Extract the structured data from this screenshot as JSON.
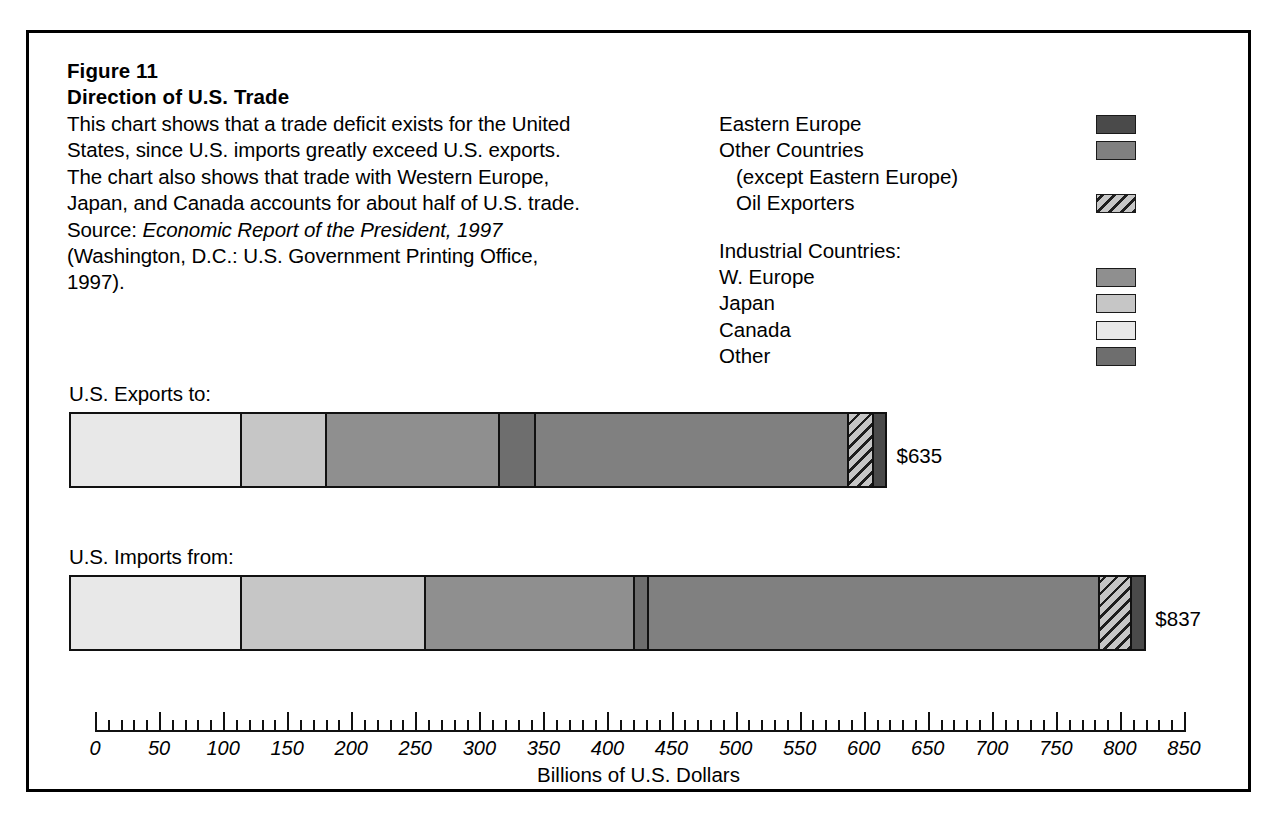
{
  "figure": {
    "number": "Figure 11",
    "title": "Direction of U.S. Trade",
    "caption_part1": "This chart shows that a trade deficit exists for the United States, since U.S. imports greatly exceed U.S. exports. The chart also shows that trade with Western Europe, Japan, and Canada accounts for about half of U.S. trade. Source: ",
    "caption_source_italic": "Economic Report of the President, 1997",
    "caption_part2": " (Washington, D.C.: U.S. Government Printing Office, 1997)."
  },
  "legend": {
    "items": [
      {
        "label": "Eastern Europe",
        "swatch": "solid",
        "color": "#4a4a4a",
        "indent": false,
        "has_swatch": true
      },
      {
        "label": "Other Countries",
        "swatch": "solid",
        "color": "#808080",
        "indent": false,
        "has_swatch": true
      },
      {
        "label": "(except Eastern Europe)",
        "swatch": "none",
        "color": "",
        "indent": true,
        "has_swatch": false
      },
      {
        "label": "Oil Exporters",
        "swatch": "hatch",
        "color": "#b9b9b9",
        "indent": true,
        "has_swatch": true
      }
    ],
    "group_heading": "Industrial Countries:",
    "group_items": [
      {
        "label": "W. Europe",
        "swatch": "solid",
        "color": "#8f8f8f",
        "indent": false,
        "has_swatch": true
      },
      {
        "label": "Japan",
        "swatch": "solid",
        "color": "#c6c6c6",
        "indent": false,
        "has_swatch": true
      },
      {
        "label": "Canada",
        "swatch": "solid",
        "color": "#e8e8e8",
        "indent": false,
        "has_swatch": true
      },
      {
        "label": "Other",
        "swatch": "solid",
        "color": "#6e6e6e",
        "indent": false,
        "has_swatch": true
      }
    ]
  },
  "chart_data": {
    "type": "bar",
    "orientation": "horizontal",
    "stacked": true,
    "title": "Direction of U.S. Trade",
    "xlabel": "Billions of U.S. Dollars",
    "ylabel": "",
    "xlim": [
      0,
      850
    ],
    "xticks": [
      0,
      50,
      100,
      150,
      200,
      250,
      300,
      350,
      400,
      450,
      500,
      550,
      600,
      650,
      700,
      750,
      800,
      850
    ],
    "xtick_labels": [
      "0",
      "50",
      "100",
      "150",
      "200",
      "250",
      "300",
      "350",
      "400",
      "450",
      "500",
      "550",
      "600",
      "650",
      "700",
      "750",
      "800",
      "850"
    ],
    "minor_tick_step": 10,
    "grid": false,
    "legend_position": "top-right",
    "categories": [
      "U.S. Exports to:",
      "U.S. Imports from:"
    ],
    "series": [
      {
        "name": "Canada",
        "color": "#e8e8e8",
        "pattern": "solid",
        "values": [
          137,
          134
        ]
      },
      {
        "name": "Japan",
        "color": "#c6c6c6",
        "pattern": "solid",
        "values": [
          68,
          145
        ]
      },
      {
        "name": "W. Europe",
        "color": "#8f8f8f",
        "pattern": "solid",
        "values": [
          138,
          164
        ]
      },
      {
        "name": "Other",
        "color": "#6e6e6e",
        "pattern": "solid",
        "values": [
          29,
          11
        ]
      },
      {
        "name": "Other Countries",
        "color": "#808080",
        "pattern": "solid",
        "values": [
          250,
          355
        ]
      },
      {
        "name": "Oil Exporters",
        "color": "#b9b9b9",
        "pattern": "hatch",
        "values": [
          20,
          25
        ]
      },
      {
        "name": "Eastern Europe",
        "color": "#4a4a4a",
        "pattern": "solid",
        "values": [
          9,
          9
        ]
      }
    ],
    "totals": [
      635,
      837
    ],
    "total_labels": [
      "$635",
      "$837"
    ]
  },
  "bars": [
    {
      "label": "U.S. Exports to:",
      "total_label": "$635"
    },
    {
      "label": "U.S. Imports from:",
      "total_label": "$837"
    }
  ]
}
